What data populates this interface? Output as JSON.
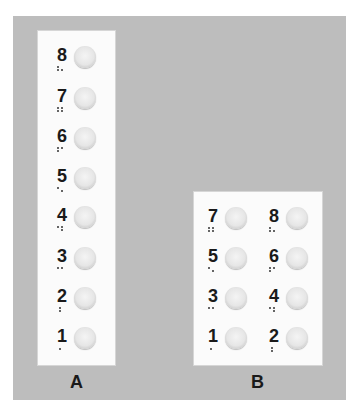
{
  "panels": {
    "a": {
      "label": "A",
      "layout": "single-column",
      "keys": [
        {
          "num": "8",
          "dots": [
            1,
            2,
            5
          ]
        },
        {
          "num": "7",
          "dots": [
            1,
            2,
            4,
            5
          ]
        },
        {
          "num": "6",
          "dots": [
            1,
            2,
            4
          ]
        },
        {
          "num": "5",
          "dots": [
            1,
            5
          ]
        },
        {
          "num": "4",
          "dots": [
            1,
            4,
            5
          ]
        },
        {
          "num": "3",
          "dots": [
            1,
            4
          ]
        },
        {
          "num": "2",
          "dots": [
            1,
            2
          ]
        },
        {
          "num": "1",
          "dots": [
            1
          ]
        }
      ]
    },
    "b": {
      "label": "B",
      "layout": "two-column",
      "keys": [
        {
          "num": "7",
          "dots": [
            1,
            2,
            4,
            5
          ]
        },
        {
          "num": "8",
          "dots": [
            1,
            2,
            5
          ]
        },
        {
          "num": "5",
          "dots": [
            1,
            5
          ]
        },
        {
          "num": "6",
          "dots": [
            1,
            2,
            4
          ]
        },
        {
          "num": "3",
          "dots": [
            1,
            4
          ]
        },
        {
          "num": "4",
          "dots": [
            1,
            4,
            5
          ]
        },
        {
          "num": "1",
          "dots": [
            1
          ]
        },
        {
          "num": "2",
          "dots": [
            1,
            2
          ]
        }
      ]
    }
  },
  "colors": {
    "background": "#bdbdbd",
    "panel": "#fbfbfb",
    "button": "#e6e6e6",
    "text": "#1a1a1a"
  }
}
